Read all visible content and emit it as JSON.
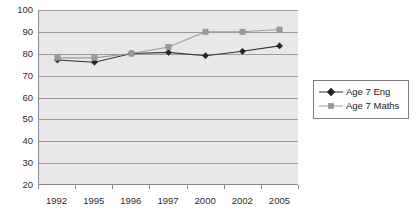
{
  "chart_data": {
    "type": "line",
    "title": "",
    "subtitle": "",
    "xlabel": "",
    "ylabel": "",
    "categories": [
      "1992",
      "1995",
      "1996",
      "1997",
      "2000",
      "2002",
      "2005"
    ],
    "series": [
      {
        "name": "Age 7 Eng",
        "marker": "diamond",
        "color": "#333333",
        "values": [
          77,
          76,
          80,
          80.5,
          79,
          81,
          83.5
        ]
      },
      {
        "name": "Age 7 Maths",
        "marker": "square",
        "color": "#9a9a9a",
        "values": [
          78,
          78,
          80,
          83,
          90,
          90,
          91
        ]
      }
    ],
    "ylim": [
      20,
      100
    ],
    "yticks": [
      20,
      30,
      40,
      50,
      60,
      70,
      80,
      90,
      100
    ],
    "ytick_labels": [
      "20",
      "30",
      "40",
      "50",
      "60",
      "70",
      "80",
      "90",
      "100"
    ],
    "grid": true,
    "grid_axis": "y",
    "legend_position": "right",
    "plot_background": "#e8e8e8"
  },
  "legend": {
    "entries": [
      {
        "label": "Age 7 Eng"
      },
      {
        "label": "Age 7 Maths"
      }
    ]
  }
}
